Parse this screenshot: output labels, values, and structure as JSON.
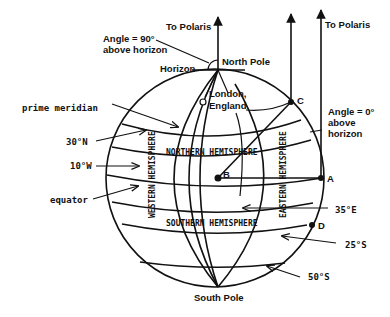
{
  "diagram": {
    "labels": {
      "to_polaris_left": "To Polaris",
      "to_polaris_right": "To Polaris",
      "angle_90_line1": "Angle = 90°",
      "angle_90_line2": "above horizon",
      "horizon": "Horizon",
      "north_pole": "North Pole",
      "south_pole": "South Pole",
      "london_line1": "London,",
      "london_line2": "England",
      "angle_0_line1": "Angle = 0°",
      "angle_0_line2": "above",
      "angle_0_line3": "horizon",
      "prime_meridian": "prime meridian",
      "lat_30n": "30°N",
      "lon_10w": "10°W",
      "equator": "equator",
      "lon_35e": "35°E",
      "lat_25s": "25°S",
      "lat_50s": "50°S",
      "northern_hemisphere": "NORTHERN HEMISPHERE",
      "southern_hemisphere": "SOUTHERN HEMISPHERE",
      "western_hemisphere": "WESTERN HEMISPHERE",
      "eastern_hemisphere": "EASTERN HEMISPHERE"
    },
    "points": {
      "A": "A",
      "B": "B",
      "C": "C",
      "D": "D"
    }
  }
}
